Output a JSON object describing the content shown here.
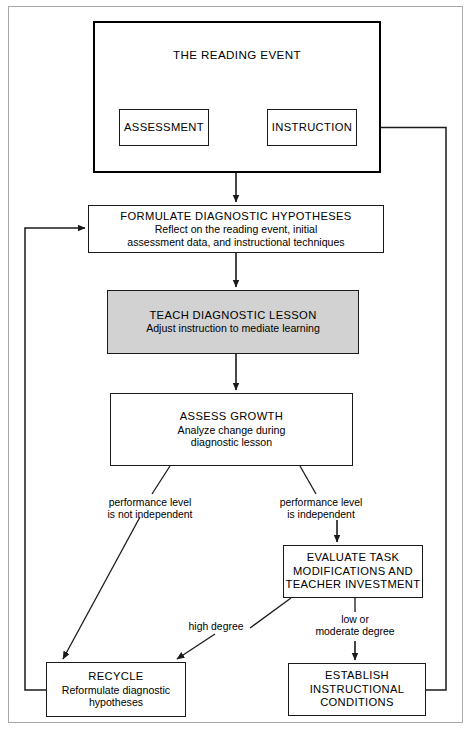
{
  "figure": {
    "outer_frame": "page-border",
    "reading_event": {
      "title": "THE READING EVENT",
      "assessment": "ASSESSMENT",
      "instruction": "INSTRUCTION"
    },
    "nodes": {
      "formulate": {
        "heading": "FORMULATE DIAGNOSTIC HYPOTHESES",
        "detail": "Reflect on the reading event, initial\nassessment data, and instructional techniques"
      },
      "teach": {
        "heading": "TEACH DIAGNOSTIC LESSON",
        "detail": "Adjust instruction to mediate learning",
        "fill": "#d2d2d2"
      },
      "assess": {
        "heading": "ASSESS GROWTH",
        "detail": "Analyze change during\ndiagnostic lesson"
      },
      "evaluate": {
        "heading": "EVALUATE TASK\nMODIFICATIONS AND\nTEACHER INVESTMENT",
        "detail": ""
      },
      "recycle": {
        "heading": "RECYCLE",
        "detail": "Reformulate diagnostic\nhypotheses"
      },
      "establish": {
        "heading": "ESTABLISH\nINSTRUCTIONAL\nCONDITIONS",
        "detail": ""
      }
    },
    "edge_labels": {
      "not_independent": "performance level\nis not independent",
      "independent": "performance level\nis independent",
      "high_degree": "high degree",
      "moderate_degree": "low or\nmoderate degree"
    },
    "colors": {
      "line": "#1a1a1a",
      "frame": "#a8a8a8",
      "teach_fill": "#d2d2d2",
      "background": "#ffffff"
    }
  }
}
